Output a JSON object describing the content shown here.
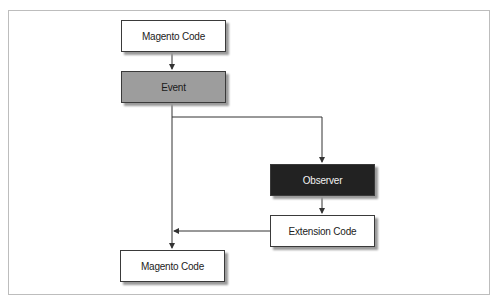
{
  "diagram": {
    "nodes": [
      {
        "id": "magento-code-top",
        "label": "Magento Code",
        "style": "light"
      },
      {
        "id": "event",
        "label": "Event",
        "style": "mid"
      },
      {
        "id": "observer",
        "label": "Observer",
        "style": "dark"
      },
      {
        "id": "extension-code",
        "label": "Extension Code",
        "style": "light"
      },
      {
        "id": "magento-code-bottom",
        "label": "Magento Code",
        "style": "light"
      }
    ],
    "edges": [
      {
        "from": "magento-code-top",
        "to": "event"
      },
      {
        "from": "event",
        "to": "observer"
      },
      {
        "from": "event",
        "to": "magento-code-bottom"
      },
      {
        "from": "observer",
        "to": "extension-code"
      },
      {
        "from": "extension-code",
        "to": "magento-code-bottom",
        "note": "joins main line"
      }
    ],
    "colors": {
      "light_fill": "#ffffff",
      "event_fill": "#9d9d9d",
      "observer_fill": "#222222",
      "line": "#333333",
      "frame": "#bdbdbd"
    }
  }
}
